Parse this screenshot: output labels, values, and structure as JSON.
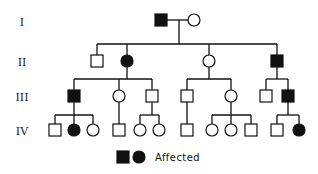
{
  "diagram": {
    "type": "pedigree",
    "generations": [
      {
        "label": "I",
        "y": 22
      },
      {
        "label": "II",
        "y": 62
      },
      {
        "label": "III",
        "y": 97
      },
      {
        "label": "IV",
        "y": 131
      }
    ],
    "individuals": [
      {
        "id": "I-1",
        "gen": "I",
        "sex": "male",
        "affected": true,
        "x": 161,
        "y": 20
      },
      {
        "id": "I-2",
        "gen": "I",
        "sex": "female",
        "affected": false,
        "x": 194,
        "y": 20
      },
      {
        "id": "II-1",
        "gen": "II",
        "sex": "male",
        "affected": false,
        "x": 97,
        "y": 61
      },
      {
        "id": "II-2",
        "gen": "II",
        "sex": "female",
        "affected": true,
        "x": 127,
        "y": 61
      },
      {
        "id": "II-3",
        "gen": "II",
        "sex": "female",
        "affected": false,
        "x": 209,
        "y": 61
      },
      {
        "id": "II-4",
        "gen": "II",
        "sex": "male",
        "affected": true,
        "x": 277,
        "y": 61
      },
      {
        "id": "III-1",
        "gen": "III",
        "sex": "male",
        "affected": true,
        "x": 74,
        "y": 96
      },
      {
        "id": "III-2",
        "gen": "III",
        "sex": "female",
        "affected": false,
        "x": 119,
        "y": 96
      },
      {
        "id": "III-3",
        "gen": "III",
        "sex": "male",
        "affected": false,
        "x": 152,
        "y": 96
      },
      {
        "id": "III-4",
        "gen": "III",
        "sex": "male",
        "affected": false,
        "x": 187,
        "y": 96
      },
      {
        "id": "III-5",
        "gen": "III",
        "sex": "female",
        "affected": false,
        "x": 231,
        "y": 96
      },
      {
        "id": "III-6",
        "gen": "III",
        "sex": "male",
        "affected": false,
        "x": 266,
        "y": 96
      },
      {
        "id": "III-7",
        "gen": "III",
        "sex": "male",
        "affected": true,
        "x": 288,
        "y": 96
      },
      {
        "id": "IV-1",
        "gen": "IV",
        "sex": "male",
        "affected": false,
        "x": 55,
        "y": 130
      },
      {
        "id": "IV-2",
        "gen": "IV",
        "sex": "female",
        "affected": true,
        "x": 74,
        "y": 130
      },
      {
        "id": "IV-3",
        "gen": "IV",
        "sex": "female",
        "affected": false,
        "x": 93,
        "y": 130
      },
      {
        "id": "IV-4",
        "gen": "IV",
        "sex": "male",
        "affected": false,
        "x": 119,
        "y": 130
      },
      {
        "id": "IV-5",
        "gen": "IV",
        "sex": "female",
        "affected": false,
        "x": 140,
        "y": 130
      },
      {
        "id": "IV-6",
        "gen": "IV",
        "sex": "female",
        "affected": false,
        "x": 159,
        "y": 130
      },
      {
        "id": "IV-7",
        "gen": "IV",
        "sex": "male",
        "affected": false,
        "x": 187,
        "y": 130
      },
      {
        "id": "IV-8",
        "gen": "IV",
        "sex": "female",
        "affected": false,
        "x": 212,
        "y": 130
      },
      {
        "id": "IV-9",
        "gen": "IV",
        "sex": "female",
        "affected": false,
        "x": 231,
        "y": 130
      },
      {
        "id": "IV-10",
        "gen": "IV",
        "sex": "male",
        "affected": false,
        "x": 251,
        "y": 130
      },
      {
        "id": "IV-11",
        "gen": "IV",
        "sex": "male",
        "affected": false,
        "x": 277,
        "y": 130
      },
      {
        "id": "IV-12",
        "gen": "IV",
        "sex": "female",
        "affected": true,
        "x": 299,
        "y": 130
      }
    ],
    "legend": {
      "label": "Affected",
      "symbols": [
        "filled-square",
        "filled-circle"
      ]
    }
  }
}
